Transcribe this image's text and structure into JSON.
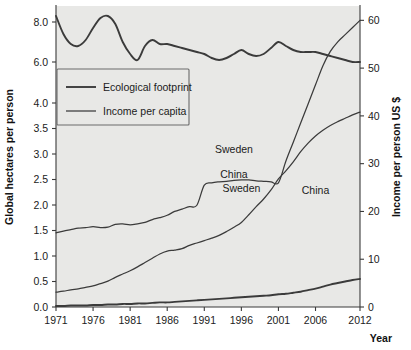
{
  "chart_data": {
    "type": "line",
    "title": "",
    "subtitle": "",
    "xlabel": "Year",
    "ylabel": "Global hectares per person",
    "ylabel_right": "Income per person US $",
    "grid": false,
    "legend_position": "inner-upper-left",
    "x": [
      1971,
      1972,
      1973,
      1974,
      1975,
      1976,
      1977,
      1978,
      1979,
      1980,
      1981,
      1982,
      1983,
      1984,
      1985,
      1986,
      1987,
      1988,
      1989,
      1990,
      1991,
      1992,
      1993,
      1994,
      1995,
      1996,
      1997,
      1998,
      1999,
      2000,
      2001,
      2002,
      2003,
      2004,
      2005,
      2006,
      2007,
      2008,
      2009,
      2010,
      2011,
      2012
    ],
    "xlim": [
      1971,
      2012
    ],
    "x_ticks": [
      "1971",
      "1976",
      "1981",
      "1986",
      "1991",
      "1996",
      "2001",
      "2006",
      "2012"
    ],
    "x_tick_values": [
      1971,
      1976,
      1981,
      1986,
      1991,
      1996,
      2001,
      2006,
      2012
    ],
    "y_ticks_left": [
      "0.0",
      "0.5",
      "1.0",
      "1.5",
      "2.0",
      "2.5",
      "3.0",
      "3.5",
      "4.0",
      "6.0",
      "8.0"
    ],
    "y_tick_values_left": [
      0.0,
      0.5,
      1.0,
      1.5,
      2.0,
      2.5,
      3.0,
      3.5,
      4.0,
      6.0,
      8.0
    ],
    "y_axis_note_left": "non-linear break between 4.0 and 6.0",
    "y_ticks_right": [
      "0",
      "10",
      "20",
      "30",
      "40",
      "50",
      "60"
    ],
    "y_tick_values_right": [
      0,
      10,
      20,
      30,
      40,
      50,
      60
    ],
    "ylim_right": [
      0,
      63
    ],
    "legend": [
      {
        "label": "Ecological footprint",
        "style": "thick"
      },
      {
        "label": "Income per capita",
        "style": "thin"
      }
    ],
    "annotations": [
      {
        "text": "Sweden",
        "series": "sweden_footprint",
        "x": 1996,
        "y_axis": "left"
      },
      {
        "text": "Sweden",
        "series": "sweden_income",
        "x": 1995,
        "y_axis": "right"
      },
      {
        "text": "China",
        "series": "china_income",
        "x": 1995,
        "y_axis": "right"
      },
      {
        "text": "China",
        "series": "china_footprint",
        "x": 2006,
        "y_axis": "left"
      }
    ],
    "series": [
      {
        "name": "Sweden ecological footprint",
        "axis": "left",
        "style": "thick",
        "unit": "global hectares per person",
        "values": [
          8.3,
          7.4,
          6.9,
          6.8,
          7.1,
          7.7,
          8.2,
          8.3,
          7.9,
          7.0,
          6.4,
          6.1,
          6.8,
          7.1,
          6.9,
          6.9,
          6.8,
          6.7,
          6.6,
          6.5,
          6.4,
          6.2,
          6.1,
          6.2,
          6.4,
          6.6,
          6.4,
          6.3,
          6.4,
          6.7,
          7.0,
          6.8,
          6.6,
          6.5,
          6.5,
          6.5,
          6.4,
          6.3,
          6.2,
          6.1,
          6.0,
          6.0
        ]
      },
      {
        "name": "China ecological footprint",
        "axis": "left",
        "style": "thick",
        "unit": "global hectares per person",
        "values": [
          0.02,
          0.02,
          0.03,
          0.03,
          0.03,
          0.04,
          0.04,
          0.05,
          0.05,
          0.06,
          0.06,
          0.07,
          0.07,
          0.08,
          0.09,
          0.09,
          0.1,
          0.11,
          0.12,
          0.13,
          0.14,
          0.15,
          0.16,
          0.17,
          0.18,
          0.19,
          0.2,
          0.21,
          0.22,
          0.23,
          0.25,
          0.26,
          0.28,
          0.3,
          0.33,
          0.36,
          0.4,
          0.44,
          0.47,
          0.5,
          0.53,
          0.55
        ]
      },
      {
        "name": "Sweden income per capita",
        "axis": "right",
        "style": "thin",
        "unit": "thousand US $",
        "values": [
          15.5,
          15.9,
          16.2,
          16.5,
          16.6,
          16.8,
          16.6,
          16.7,
          17.3,
          17.4,
          17.2,
          17.4,
          17.7,
          18.3,
          18.7,
          19.2,
          20.0,
          20.5,
          21.0,
          21.3,
          25.5,
          26.0,
          26.2,
          26.3,
          26.5,
          26.6,
          26.6,
          26.4,
          26.3,
          26.2,
          26.0,
          30.5,
          34.5,
          38.5,
          42.5,
          46.5,
          50.5,
          53.5,
          55.5,
          57.0,
          58.5,
          60.0
        ]
      },
      {
        "name": "China income per capita",
        "axis": "right",
        "style": "thin",
        "unit": "thousand US $",
        "values": [
          3.1,
          3.3,
          3.6,
          3.8,
          4.1,
          4.4,
          4.9,
          5.4,
          6.2,
          6.9,
          7.6,
          8.4,
          9.3,
          10.2,
          11.1,
          11.7,
          11.9,
          12.2,
          12.9,
          13.4,
          13.9,
          14.4,
          15.0,
          15.8,
          16.7,
          17.7,
          19.3,
          21.0,
          22.6,
          24.5,
          26.8,
          28.5,
          30.4,
          32.5,
          34.3,
          35.8,
          37.0,
          38.0,
          38.8,
          39.5,
          40.2,
          40.8
        ]
      }
    ]
  },
  "axes": {
    "left_title": "Global hectares per person",
    "right_title": "Income per person US $",
    "bottom_title": "Year"
  },
  "colors": {
    "plot_background": "#e8e8e6",
    "line": "#3b3b3b",
    "axis": "#3a3a3a",
    "text": "#1b1b1b",
    "page_background": "#ffffff"
  }
}
